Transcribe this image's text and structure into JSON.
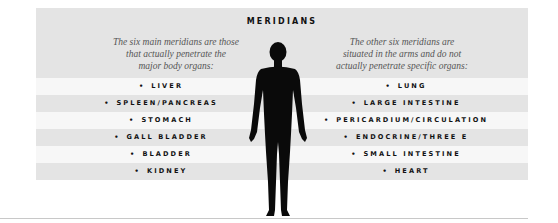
{
  "title": "MERIDIANS",
  "left_intro": [
    "The six main meridians are those",
    "that actually penetrate the",
    "major body organs:"
  ],
  "right_intro": [
    "The other six meridians are",
    "situated in the arms and do not",
    "actually penetrate specific organs:"
  ],
  "bullet": "•",
  "left_items": [
    "LIVER",
    "SPLEEN/PANCREAS",
    "STOMACH",
    "GALL BLADDER",
    "BLADDER",
    "KIDNEY"
  ],
  "right_items": [
    "LUNG",
    "LARGE INTESTINE",
    "PERICARDIUM/CIRCULATION",
    "ENDOCRINE/THREE E",
    "SMALL INTESTINE",
    "HEART"
  ],
  "figure": "human-body-silhouette",
  "colors": {
    "band_gray": "#e4e4e4",
    "band_white": "#f7f7f7",
    "text": "#111111",
    "italic_text": "#555555"
  }
}
